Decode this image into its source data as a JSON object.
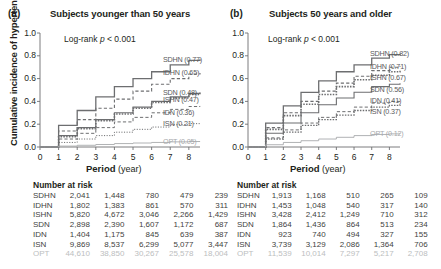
{
  "figure": {
    "yaxis_title": "Cumulative incidence of hypertension",
    "xaxis_title_bold": "Period",
    "xaxis_title_rest": "(year)",
    "ytick_labels": [
      "1.0",
      "0.8",
      "0.6",
      "0.4",
      "0.2",
      "0.0"
    ],
    "ytick_values": [
      1.0,
      0.8,
      0.6,
      0.4,
      0.2,
      0.0
    ],
    "xtick_labels": [
      "0",
      "1",
      "2",
      "3",
      "4",
      "5",
      "6",
      "7",
      "8"
    ],
    "xtick_values": [
      0,
      1,
      2,
      3,
      4,
      5,
      6,
      7,
      8
    ],
    "number_at_risk_title": "Number at risk",
    "logrank_text": "Log-rank ",
    "logrank_p": "p",
    "logrank_value": " < 0.001",
    "colors": {
      "line": "#6d6e70",
      "opt_line": "#a7a9ac",
      "text": "#231f20",
      "legend_text": "#58595b",
      "opt_text": "#a7a9ac",
      "table_text": "#3f3f41",
      "opt_table_text": "#bcbec0"
    }
  },
  "panels": [
    {
      "letter": "(a)",
      "title": "Subjects younger than 50 years",
      "legend": [
        {
          "label": "SDHN (0.77)",
          "group": "SDHN",
          "value": 0.77
        },
        {
          "label": "IDHN (0.65)",
          "group": "IDHN",
          "value": 0.65
        },
        {
          "label": "SDN (0.48)",
          "group": "SDN",
          "value": 0.48
        },
        {
          "label": "ISHN (0.47)",
          "group": "ISHN",
          "value": 0.47
        },
        {
          "label": "IDN (0.36)",
          "group": "IDN",
          "value": 0.36
        },
        {
          "label": "ISN (0.21)",
          "group": "ISN",
          "value": 0.21
        },
        {
          "label": "OPT (0.05)",
          "group": "OPT",
          "value": 0.05
        }
      ],
      "number_at_risk": {
        "columns": [
          "0",
          "2",
          "4",
          "6",
          "8"
        ],
        "rows": [
          {
            "label": "SDHN",
            "values": [
              "2,041",
              "1,448",
              "780",
              "479",
              "239"
            ]
          },
          {
            "label": "IDHN",
            "values": [
              "1,802",
              "1,383",
              "861",
              "570",
              "311"
            ]
          },
          {
            "label": "ISHN",
            "values": [
              "5,820",
              "4,672",
              "3,046",
              "2,266",
              "1,429"
            ]
          },
          {
            "label": "SDN",
            "values": [
              "2,898",
              "2,390",
              "1,607",
              "1,172",
              "687"
            ]
          },
          {
            "label": "IDN",
            "values": [
              "1,404",
              "1,175",
              "845",
              "639",
              "387"
            ]
          },
          {
            "label": "ISN",
            "values": [
              "9,869",
              "8,537",
              "6,299",
              "5,077",
              "3,447"
            ]
          },
          {
            "label": "OPT",
            "values": [
              "44,610",
              "38,850",
              "30,267",
              "25,578",
              "18,004"
            ]
          }
        ]
      }
    },
    {
      "letter": "(b)",
      "title": "Subjects 50 years and older",
      "legend": [
        {
          "label": "SDHN (0.82)",
          "group": "SDHN",
          "value": 0.82
        },
        {
          "label": "IDHN (0.71)",
          "group": "IDHN",
          "value": 0.71
        },
        {
          "label": "ISHN (0.67)",
          "group": "ISHN",
          "value": 0.67
        },
        {
          "label": "SDN (0.56)",
          "group": "SDN",
          "value": 0.56
        },
        {
          "label": "IDN (0.41)",
          "group": "IDN",
          "value": 0.41
        },
        {
          "label": "ISN (0.37)",
          "group": "ISN",
          "value": 0.37
        },
        {
          "label": "OPT (0.12)",
          "group": "OPT",
          "value": 0.12
        }
      ],
      "number_at_risk": {
        "columns": [
          "0",
          "2",
          "4",
          "6",
          "8"
        ],
        "rows": [
          {
            "label": "SDHN",
            "values": [
              "1,913",
              "1,168",
              "510",
              "265",
              "109"
            ]
          },
          {
            "label": "IDHN",
            "values": [
              "1,453",
              "1,048",
              "540",
              "317",
              "140"
            ]
          },
          {
            "label": "ISHN",
            "values": [
              "3,428",
              "2,412",
              "1,249",
              "710",
              "312"
            ]
          },
          {
            "label": "SDN",
            "values": [
              "1,864",
              "1,436",
              "864",
              "513",
              "234"
            ]
          },
          {
            "label": "IDN",
            "values": [
              "923",
              "740",
              "494",
              "327",
              "155"
            ]
          },
          {
            "label": "ISN",
            "values": [
              "3,739",
              "3,129",
              "2,086",
              "1,364",
              "706"
            ]
          },
          {
            "label": "OPT",
            "values": [
              "11,539",
              "10,014",
              "7,297",
              "5,217",
              "2,708"
            ]
          }
        ]
      }
    }
  ],
  "chart_data": {
    "type": "line",
    "xlabel": "Period (year)",
    "ylabel": "Cumulative incidence of hypertension",
    "xlim": [
      0,
      8.6
    ],
    "ylim": [
      0,
      1.0
    ],
    "grid": false,
    "legend_position": "right-inside",
    "x": [
      0,
      1,
      2,
      3,
      4,
      5,
      6,
      7,
      8,
      8.6
    ],
    "charts": [
      {
        "panel": "(a)",
        "subtitle": "Subjects younger than 50 years",
        "series": [
          {
            "name": "SDHN",
            "style": "solid",
            "width": 1.3,
            "values": [
              0,
              0.19,
              0.32,
              0.44,
              0.53,
              0.6,
              0.66,
              0.72,
              0.76,
              0.77
            ]
          },
          {
            "name": "IDHN",
            "style": "dashed",
            "width": 1.1,
            "values": [
              0,
              0.14,
              0.24,
              0.34,
              0.42,
              0.49,
              0.55,
              0.6,
              0.64,
              0.65
            ]
          },
          {
            "name": "SDN",
            "style": "solid",
            "width": 1.1,
            "values": [
              0,
              0.1,
              0.17,
              0.24,
              0.3,
              0.35,
              0.4,
              0.44,
              0.47,
              0.48
            ]
          },
          {
            "name": "ISHN",
            "style": "dotted-bold",
            "width": 1.6,
            "values": [
              0,
              0.09,
              0.16,
              0.23,
              0.29,
              0.34,
              0.39,
              0.43,
              0.46,
              0.47
            ]
          },
          {
            "name": "IDN",
            "style": "dashed",
            "width": 1.0,
            "values": [
              0,
              0.07,
              0.12,
              0.17,
              0.22,
              0.26,
              0.3,
              0.33,
              0.355,
              0.36
            ]
          },
          {
            "name": "ISN",
            "style": "dotted",
            "width": 1.0,
            "values": [
              0,
              0.04,
              0.07,
              0.1,
              0.13,
              0.155,
              0.175,
              0.195,
              0.205,
              0.21
            ]
          },
          {
            "name": "OPT",
            "style": "solid-light",
            "width": 0.9,
            "values": [
              0,
              0.008,
              0.015,
              0.022,
              0.03,
              0.035,
              0.04,
              0.045,
              0.048,
              0.05
            ]
          }
        ]
      },
      {
        "panel": "(b)",
        "subtitle": "Subjects 50 years and older",
        "series": [
          {
            "name": "SDHN",
            "style": "solid",
            "width": 1.3,
            "values": [
              0,
              0.21,
              0.36,
              0.48,
              0.58,
              0.66,
              0.72,
              0.78,
              0.81,
              0.82
            ]
          },
          {
            "name": "IDHN",
            "style": "dashed",
            "width": 1.1,
            "values": [
              0,
              0.17,
              0.3,
              0.4,
              0.49,
              0.56,
              0.62,
              0.67,
              0.7,
              0.71
            ]
          },
          {
            "name": "ISHN",
            "style": "dotted-bold",
            "width": 1.6,
            "values": [
              0,
              0.155,
              0.275,
              0.375,
              0.46,
              0.53,
              0.59,
              0.63,
              0.66,
              0.67
            ]
          },
          {
            "name": "SDN",
            "style": "solid",
            "width": 1.1,
            "values": [
              0,
              0.12,
              0.21,
              0.3,
              0.37,
              0.43,
              0.48,
              0.53,
              0.55,
              0.56
            ]
          },
          {
            "name": "IDN",
            "style": "dashed",
            "width": 1.0,
            "values": [
              0,
              0.08,
              0.15,
              0.21,
              0.26,
              0.31,
              0.35,
              0.385,
              0.4,
              0.41
            ]
          },
          {
            "name": "ISN",
            "style": "dotted-bold",
            "width": 1.3,
            "values": [
              0,
              0.07,
              0.13,
              0.19,
              0.24,
              0.28,
              0.32,
              0.35,
              0.365,
              0.37
            ]
          },
          {
            "name": "OPT",
            "style": "solid-light",
            "width": 0.9,
            "values": [
              0,
              0.02,
              0.04,
              0.055,
              0.07,
              0.085,
              0.1,
              0.11,
              0.115,
              0.12
            ]
          }
        ]
      }
    ]
  }
}
